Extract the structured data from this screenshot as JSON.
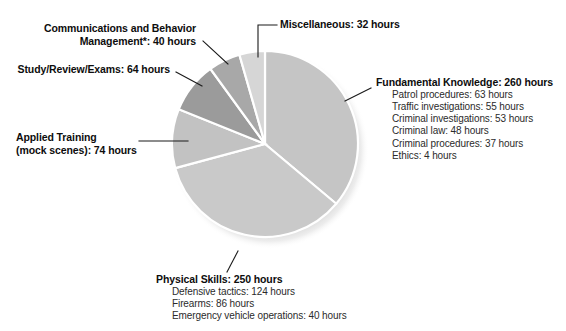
{
  "chart_data": {
    "type": "pie",
    "title": "",
    "unit": "hours",
    "total": 720,
    "legend_position": "callout-labels",
    "start_angle_deg": 0,
    "direction": "clockwise",
    "categories": [
      "Fundamental Knowledge",
      "Physical Skills",
      "Applied Training (mock scenes)",
      "Study/Review/Exams",
      "Communications and Behavior Management*",
      "Miscellaneous"
    ],
    "values": [
      260,
      250,
      74,
      64,
      40,
      32
    ],
    "colors": [
      "#c5c5c5",
      "#c9c9c9",
      "#c2c2c2",
      "#9b9b9b",
      "#a8a8a8",
      "#d6d6d6"
    ],
    "slices": [
      {
        "name": "Fundamental Knowledge",
        "label": "Fundamental Knowledge: 260 hours",
        "value": 260,
        "color": "#c5c5c5",
        "start_deg": 0,
        "sweep_deg": 130,
        "breakdown": [
          "Patrol procedures: 63 hours",
          "Traffic investigations: 55 hours",
          "Criminal investigations: 53 hours",
          "Criminal law: 48 hours",
          "Criminal procedures: 37 hours",
          "Ethics: 4 hours"
        ]
      },
      {
        "name": "Physical Skills",
        "label": "Physical Skills: 250 hours",
        "value": 250,
        "color": "#c9c9c9",
        "start_deg": 130,
        "sweep_deg": 125,
        "breakdown": [
          "Defensive tactics: 124 hours",
          "Firearms: 86 hours",
          "Emergency vehicle operations: 40 hours"
        ]
      },
      {
        "name": "Applied Training",
        "label_line1": "Applied Training",
        "label_line2": "(mock scenes): 74 hours",
        "value": 74,
        "color": "#c2c2c2",
        "start_deg": 255,
        "sweep_deg": 37,
        "breakdown": []
      },
      {
        "name": "Study/Review/Exams",
        "label": "Study/Review/Exams: 64 hours",
        "value": 64,
        "color": "#9b9b9b",
        "start_deg": 292,
        "sweep_deg": 32,
        "breakdown": []
      },
      {
        "name": "Communications and Behavior Management",
        "label_line1": "Communications and Behavior",
        "label_line2": "Management*: 40 hours",
        "value": 40,
        "color": "#a8a8a8",
        "start_deg": 324,
        "sweep_deg": 20,
        "breakdown": []
      },
      {
        "name": "Miscellaneous",
        "label": "Miscellaneous: 32 hours",
        "value": 32,
        "color": "#d6d6d6",
        "start_deg": 344,
        "sweep_deg": 16,
        "breakdown": []
      }
    ]
  },
  "labels": {
    "miscellaneous": {
      "title": "Miscellaneous: 32 hours"
    },
    "communications": {
      "line1": "Communications and Behavior",
      "line2": "Management*: 40 hours"
    },
    "study": {
      "title": "Study/Review/Exams: 64 hours"
    },
    "applied": {
      "line1": "Applied Training",
      "line2": "(mock scenes): 74 hours"
    },
    "fundamental": {
      "title": "Fundamental Knowledge: 260 hours",
      "items": [
        "Patrol procedures: 63 hours",
        "Traffic investigations: 55 hours",
        "Criminal investigations: 53 hours",
        "Criminal law: 48 hours",
        "Criminal procedures: 37 hours",
        "Ethics: 4 hours"
      ]
    },
    "physical": {
      "title": "Physical Skills: 250 hours",
      "items": [
        "Defensive tactics: 124 hours",
        "Firearms: 86 hours",
        "Emergency vehicle operations: 40 hours"
      ]
    }
  }
}
